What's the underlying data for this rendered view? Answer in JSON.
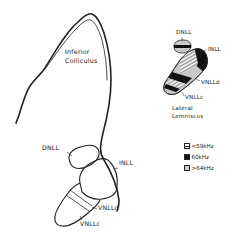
{
  "main_diagram": {
    "labels": {
      "inferior_colliculus_line1": "Inferior",
      "inferior_colliculus_line2": "Colliculus",
      "dnll": "DNLL",
      "inll": "INLL",
      "vnlld": "VNLLd",
      "vnllc": "VNLLc"
    }
  },
  "inset": {
    "labels": {
      "dnll": "DNLL",
      "inll": "INLL",
      "vnlld": "VNLLd",
      "vnllc": "VNLLc",
      "title_line1": "Lateral",
      "title_line2": "Lemniscus"
    }
  },
  "legend": {
    "items": [
      {
        "label": "<59kHz",
        "pattern": "striped"
      },
      {
        "label": "60kHz",
        "pattern": "solid-black"
      },
      {
        "label": ">64kHz",
        "pattern": "stippled"
      }
    ]
  },
  "colors": {
    "ink": "#222222",
    "stipple": "#c8c8c8",
    "background": "#ffffff"
  }
}
